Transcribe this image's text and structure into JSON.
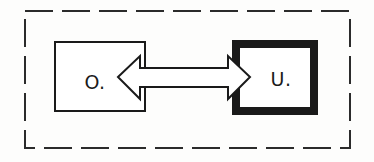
{
  "figure": {
    "title": "",
    "background_color": "#fdfdfc",
    "stroke_color": "#1a1a1a",
    "fill_color": "#ffffff"
  },
  "boundary": {
    "name": "system-boundary",
    "style": "dashed",
    "stroke_color": "#2b2b2b",
    "stroke_width": 2,
    "dash_pattern": "28 9",
    "x": 25,
    "y": 11,
    "width": 325,
    "height": 137
  },
  "nodes": [
    {
      "id": "o",
      "label": "O.",
      "border_style": "thin",
      "stroke_width": 2,
      "stroke_color": "#1a1a1a",
      "fill_color": "#ffffff",
      "x": 55,
      "y": 42,
      "width": 90,
      "height": 69,
      "label_x": 95,
      "label_y": 83
    },
    {
      "id": "u",
      "label": "U.",
      "border_style": "thick",
      "stroke_width": 8,
      "stroke_color": "#1a1a1a",
      "fill_color": "#ffffff",
      "x": 232,
      "y": 40,
      "width": 86,
      "height": 75,
      "label_x": 279,
      "label_y": 83
    }
  ],
  "connector": {
    "name": "bidirectional-arrow",
    "type": "double-headed-arrow",
    "style": "hollow-outline",
    "stroke_color": "#1a1a1a",
    "stroke_width": 2,
    "fill_color": "#ffffff",
    "left_tip_x": 118,
    "right_tip_x": 250,
    "center_y": 77,
    "shaft_top_y": 68,
    "shaft_bottom_y": 87,
    "head_top_y": 56,
    "head_bottom_y": 99,
    "head_base_left_x": 140,
    "head_base_right_x": 228,
    "direction": "bidirectional"
  }
}
